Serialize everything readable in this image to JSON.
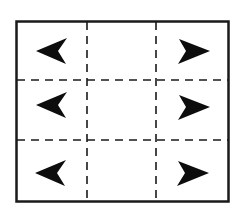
{
  "diagram": {
    "grid": {
      "rows": 3,
      "columns": 3
    },
    "colors": {
      "stroke": "#1a1a1a",
      "arrow": "#0d0d0d",
      "background": "#ffffff"
    },
    "arrows": [
      {
        "row": 1,
        "side": "left",
        "direction": "left"
      },
      {
        "row": 1,
        "side": "right",
        "direction": "right"
      },
      {
        "row": 2,
        "side": "left",
        "direction": "left"
      },
      {
        "row": 2,
        "side": "right",
        "direction": "right"
      },
      {
        "row": 3,
        "side": "left",
        "direction": "left"
      },
      {
        "row": 3,
        "side": "right",
        "direction": "right"
      }
    ]
  }
}
